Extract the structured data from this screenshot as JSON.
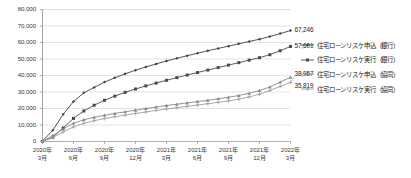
{
  "chart_data": {
    "type": "line",
    "title": "",
    "subtitle": "",
    "xlabel": "",
    "ylabel": "",
    "ylim": [
      0,
      80000
    ],
    "ytick_step": 10000,
    "ytick_labels": [
      "80,000",
      "70,000",
      "60,000",
      "50,000",
      "40,000",
      "30,000",
      "20,000",
      "10,000",
      "0"
    ],
    "ytick_values": [
      80000,
      70000,
      60000,
      50000,
      40000,
      30000,
      20000,
      10000,
      0
    ],
    "grid": true,
    "grid_axis": "y",
    "legend_position": "right",
    "categories": [
      "2020年3月",
      "2020年4月",
      "2020年5月",
      "2020年6月",
      "2020年7月",
      "2020年8月",
      "2020年9月",
      "2020年10月",
      "2020年11月",
      "2020年12月",
      "2021年1月",
      "2021年2月",
      "2021年3月",
      "2021年4月",
      "2021年5月",
      "2021年6月",
      "2021年7月",
      "2021年8月",
      "2021年9月",
      "2021年10月",
      "2021年11月",
      "2021年12月",
      "2022年1月",
      "2022年2月",
      "2022年3月"
    ],
    "xtick_labels": [
      {
        "line1": "2020年",
        "line2": "3月"
      },
      {
        "line1": "2020年",
        "line2": "6月"
      },
      {
        "line1": "2020年",
        "line2": "9月"
      },
      {
        "line1": "2020年",
        "line2": "12月"
      },
      {
        "line1": "2021年",
        "line2": "3月"
      },
      {
        "line1": "2021年",
        "line2": "6月"
      },
      {
        "line1": "2021年",
        "line2": "9月"
      },
      {
        "line1": "2021年",
        "line2": "12月"
      },
      {
        "line1": "2022年",
        "line2": "3月"
      }
    ],
    "xtick_indices": [
      0,
      3,
      6,
      9,
      12,
      15,
      18,
      21,
      24
    ],
    "series": [
      {
        "name": "住宅ローンリスケ申込（銀行）",
        "color": "#404040",
        "marker": "diamond",
        "end_label": "67,246",
        "end_value": 67246,
        "values": [
          300,
          6800,
          16500,
          24200,
          29500,
          32800,
          36000,
          38600,
          41000,
          43200,
          45200,
          47000,
          48800,
          50400,
          52000,
          53500,
          55000,
          56400,
          57800,
          59200,
          60600,
          62000,
          63600,
          65400,
          67246
        ]
      },
      {
        "name": "住宅ローンリスケ実行（銀行）",
        "color": "#4a4a4a",
        "marker": "square",
        "end_label": "57,601",
        "end_value": 57601,
        "values": [
          100,
          2600,
          8200,
          14000,
          18500,
          22000,
          25000,
          27500,
          29800,
          31800,
          33700,
          35400,
          37100,
          38700,
          40300,
          41800,
          43300,
          44800,
          46300,
          47800,
          49300,
          50800,
          52600,
          55000,
          57601
        ]
      },
      {
        "name": "住宅ローンリスケ申込（協同）",
        "color": "#8a8a8a",
        "marker": "triangle",
        "end_label": "38,957",
        "end_value": 38957,
        "values": [
          150,
          3600,
          7600,
          11000,
          13200,
          14700,
          15900,
          17000,
          18000,
          19000,
          20000,
          20900,
          21800,
          22600,
          23400,
          24200,
          25000,
          25900,
          26800,
          27900,
          29200,
          30900,
          33000,
          36000,
          38957
        ]
      },
      {
        "name": "住宅ローンリスケ実行（協同）",
        "color": "#a0a0a0",
        "marker": "cross",
        "end_label": "35,819",
        "end_value": 35819,
        "values": [
          80,
          2400,
          5800,
          8800,
          11000,
          12600,
          13900,
          15000,
          16000,
          17000,
          17900,
          18800,
          19700,
          20500,
          21300,
          22100,
          22900,
          23700,
          24600,
          25700,
          27000,
          28700,
          30900,
          33400,
          35819
        ]
      }
    ]
  },
  "axis": {
    "line_color": "#9a9a9a",
    "grid_color": "#dcdcdc"
  }
}
